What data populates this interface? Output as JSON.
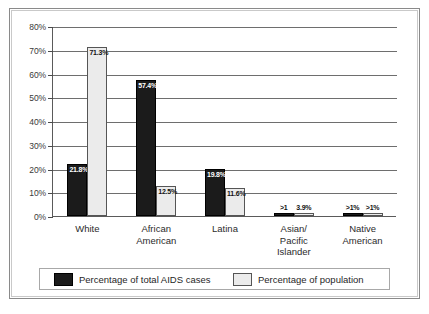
{
  "chart_data": {
    "type": "bar",
    "title": "",
    "xlabel": "",
    "ylabel": "",
    "ylim": [
      0,
      80
    ],
    "ytick_labels": [
      "0%",
      "10%",
      "20%",
      "30%",
      "40%",
      "50%",
      "60%",
      "70%",
      "80%"
    ],
    "ytick_values": [
      0,
      10,
      20,
      30,
      40,
      50,
      60,
      70,
      80
    ],
    "grid": true,
    "legend_position": "bottom",
    "categories": [
      "White",
      "African American",
      "Latina",
      "Asian/ Pacific Islander",
      "Native American"
    ],
    "category_lines": [
      [
        "White"
      ],
      [
        "African",
        "American"
      ],
      [
        "Latina"
      ],
      [
        "Asian/",
        "Pacific",
        "Islander"
      ],
      [
        "Native",
        "American"
      ]
    ],
    "series": [
      {
        "name": "Percentage of total AIDS cases",
        "color": "#1b1b1b",
        "values": [
          21.8,
          57.4,
          19.8,
          0.5,
          0.5
        ],
        "value_labels": [
          "21.8%",
          "57.4%",
          "19.8%",
          ">1",
          ">1%"
        ],
        "label_inside": [
          true,
          true,
          true,
          false,
          false
        ]
      },
      {
        "name": "Percentage of population",
        "color": "#ebebeb",
        "values": [
          71.3,
          12.5,
          11.6,
          3.9,
          0.5
        ],
        "value_labels": [
          "71.3%",
          "12.5%",
          "11.6%",
          "3.9%",
          ">1%"
        ],
        "label_inside": [
          true,
          true,
          true,
          false,
          false
        ]
      }
    ]
  },
  "legend": {
    "items": [
      {
        "label": "Percentage of total AIDS cases",
        "swatch": "dark-swatch"
      },
      {
        "label": "Percentage of population",
        "swatch": "light-swatch"
      }
    ]
  }
}
